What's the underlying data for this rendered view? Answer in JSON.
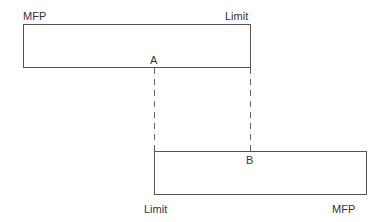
{
  "diagram": {
    "top_box": {
      "left_label": "MFP",
      "right_label": "Limit",
      "point_label": "A"
    },
    "bottom_box": {
      "left_label": "Limit",
      "right_label": "MFP",
      "point_label": "B"
    },
    "colors": {
      "line": "#555555",
      "text": "#333333",
      "background": "#ffffff"
    }
  }
}
